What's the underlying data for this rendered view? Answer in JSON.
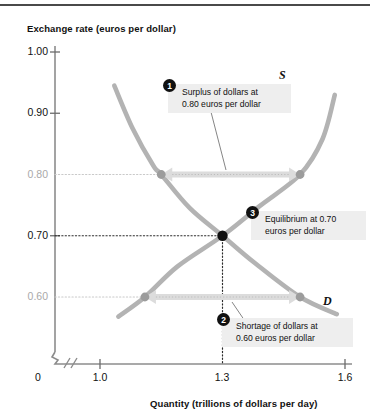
{
  "figure": {
    "y_axis_title": "Exchange rate (euros per dollar)",
    "x_axis_title": "Quantity (trillions of dollars per day)",
    "supply_label": "S",
    "demand_label": "D"
  },
  "callouts": [
    {
      "number": "1",
      "text": "Surplus of dollars at\n0.80 euros per dollar"
    },
    {
      "number": "2",
      "text": "Shortage of dollars at\n0.60 euros per dollar"
    },
    {
      "number": "3",
      "text": "Equilibrium at 0.70\neuros per dollar"
    }
  ],
  "chart_data": {
    "type": "line",
    "title": "",
    "xlabel": "Quantity (trillions of dollars per day)",
    "ylabel": "Exchange rate (euros per dollar)",
    "xlim": [
      0.93,
      1.63
    ],
    "ylim": [
      0.54,
      1.02
    ],
    "xticks": [
      "0",
      "1.0",
      "1.3",
      "1.6"
    ],
    "xtick_values": [
      0,
      1.0,
      1.3,
      1.6
    ],
    "yticks": [
      "1.00",
      "0.90",
      "0.80",
      "0.70",
      "0.60"
    ],
    "ytick_values": [
      1.0,
      0.9,
      0.8,
      0.7,
      0.6
    ],
    "ytick_muted": [
      "0.80",
      "0.60"
    ],
    "axis_break": true,
    "grid": false,
    "legend": "inline-curve-labels",
    "series": [
      {
        "name": "Demand",
        "label": "D",
        "color": "#b3b3b3",
        "points": [
          {
            "x": 1.035,
            "y": 0.945
          },
          {
            "x": 1.08,
            "y": 0.875
          },
          {
            "x": 1.13,
            "y": 0.815
          },
          {
            "x": 1.15,
            "y": 0.8
          },
          {
            "x": 1.22,
            "y": 0.745
          },
          {
            "x": 1.3,
            "y": 0.7
          },
          {
            "x": 1.38,
            "y": 0.655
          },
          {
            "x": 1.49,
            "y": 0.6
          },
          {
            "x": 1.58,
            "y": 0.572
          }
        ]
      },
      {
        "name": "Supply",
        "label": "S",
        "color": "#b3b3b3",
        "points": [
          {
            "x": 1.045,
            "y": 0.568
          },
          {
            "x": 1.11,
            "y": 0.6
          },
          {
            "x": 1.19,
            "y": 0.65
          },
          {
            "x": 1.3,
            "y": 0.7
          },
          {
            "x": 1.39,
            "y": 0.748
          },
          {
            "x": 1.49,
            "y": 0.8
          },
          {
            "x": 1.545,
            "y": 0.858
          },
          {
            "x": 1.575,
            "y": 0.93
          }
        ]
      }
    ],
    "equilibrium": {
      "x": 1.3,
      "y": 0.7,
      "marker": "filled-circle",
      "color": "#111111"
    },
    "markers": [
      {
        "x": 1.15,
        "y": 0.8,
        "series": "Demand",
        "color": "#9c9c9c"
      },
      {
        "x": 1.49,
        "y": 0.8,
        "series": "Supply",
        "color": "#9c9c9c"
      },
      {
        "x": 1.11,
        "y": 0.6,
        "series": "Supply",
        "color": "#9c9c9c"
      },
      {
        "x": 1.49,
        "y": 0.6,
        "series": "Demand",
        "color": "#9c9c9c"
      }
    ],
    "annotations": [
      {
        "name": "surplus-span",
        "y": 0.8,
        "x_from": 1.15,
        "x_to": 1.49,
        "kind": "double-arrow"
      },
      {
        "name": "shortage-span",
        "y": 0.6,
        "x_from": 1.11,
        "x_to": 1.49,
        "kind": "double-arrow"
      }
    ]
  }
}
